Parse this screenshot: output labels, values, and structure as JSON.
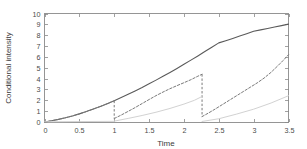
{
  "chart_data": {
    "type": "line",
    "title": "",
    "xlabel": "Time",
    "ylabel": "Conditional intensity",
    "xlim": [
      0,
      3.5
    ],
    "ylim": [
      0,
      10
    ],
    "grid": false,
    "legend": "none",
    "xticks": [
      "0",
      "0.5",
      "1",
      "1.5",
      "2",
      "2.5",
      "3",
      "3.5"
    ],
    "xtick_values": [
      0,
      0.5,
      1,
      1.5,
      2,
      2.5,
      3,
      3.5
    ],
    "yticks": [
      "0",
      "1",
      "2",
      "3",
      "4",
      "5",
      "6",
      "7",
      "8",
      "9",
      "10"
    ],
    "ytick_values": [
      0,
      1,
      2,
      3,
      4,
      5,
      6,
      7,
      8,
      9,
      10
    ],
    "event_times": [
      1.0,
      2.26
    ],
    "series": [
      {
        "name": "solid-upper-curve",
        "style": "solid",
        "color": "#5a5a5a",
        "width": 1.1,
        "points": [
          [
            0.0,
            0.0
          ],
          [
            0.1,
            0.11
          ],
          [
            0.2,
            0.24
          ],
          [
            0.3,
            0.39
          ],
          [
            0.4,
            0.56
          ],
          [
            0.5,
            0.75
          ],
          [
            0.6,
            0.96
          ],
          [
            0.7,
            1.19
          ],
          [
            0.8,
            1.43
          ],
          [
            0.9,
            1.69
          ],
          [
            1.0,
            1.96
          ],
          [
            1.1,
            2.25
          ],
          [
            1.2,
            2.55
          ],
          [
            1.3,
            2.86
          ],
          [
            1.4,
            3.18
          ],
          [
            1.5,
            3.52
          ],
          [
            1.6,
            3.86
          ],
          [
            1.7,
            4.21
          ],
          [
            1.8,
            4.57
          ],
          [
            1.9,
            4.94
          ],
          [
            2.0,
            5.32
          ],
          [
            2.1,
            5.7
          ],
          [
            2.2,
            6.09
          ],
          [
            2.3,
            6.49
          ],
          [
            2.4,
            6.89
          ],
          [
            2.5,
            7.29
          ],
          [
            2.6,
            7.49
          ],
          [
            2.7,
            7.7
          ],
          [
            2.8,
            7.92
          ],
          [
            2.9,
            8.14
          ],
          [
            3.0,
            8.36
          ],
          [
            3.1,
            8.49
          ],
          [
            3.2,
            8.62
          ],
          [
            3.3,
            8.75
          ],
          [
            3.4,
            8.88
          ],
          [
            3.5,
            9.02
          ]
        ]
      },
      {
        "name": "dashed-resetting-curve",
        "style": "dashed",
        "color": "#7a7a7a",
        "width": 1.0,
        "segments": [
          {
            "points": [
              [
                0.0,
                0.0
              ],
              [
                0.1,
                0.11
              ],
              [
                0.2,
                0.24
              ],
              [
                0.3,
                0.39
              ],
              [
                0.4,
                0.56
              ],
              [
                0.5,
                0.75
              ],
              [
                0.6,
                0.96
              ],
              [
                0.7,
                1.19
              ],
              [
                0.8,
                1.43
              ],
              [
                0.9,
                1.69
              ],
              [
                1.0,
                1.96
              ]
            ]
          },
          {
            "points": [
              [
                1.0,
                0.32
              ],
              [
                1.1,
                0.64
              ],
              [
                1.2,
                0.98
              ],
              [
                1.3,
                1.33
              ],
              [
                1.4,
                1.7
              ],
              [
                1.5,
                2.07
              ],
              [
                1.6,
                2.43
              ],
              [
                1.7,
                2.76
              ],
              [
                1.8,
                3.07
              ],
              [
                1.9,
                3.35
              ],
              [
                2.0,
                3.62
              ],
              [
                2.1,
                3.9
              ],
              [
                2.2,
                4.22
              ],
              [
                2.26,
                4.4
              ]
            ]
          },
          {
            "points": [
              [
                2.26,
                0.5
              ],
              [
                2.35,
                0.82
              ],
              [
                2.45,
                1.2
              ],
              [
                2.55,
                1.6
              ],
              [
                2.65,
                2.0
              ],
              [
                2.75,
                2.4
              ],
              [
                2.85,
                2.8
              ],
              [
                2.95,
                3.2
              ],
              [
                3.05,
                3.6
              ],
              [
                3.15,
                4.05
              ],
              [
                3.25,
                4.58
              ],
              [
                3.35,
                5.2
              ],
              [
                3.42,
                5.65
              ],
              [
                3.5,
                6.2
              ]
            ]
          }
        ],
        "drops": [
          {
            "x": 1.0,
            "from": 1.96,
            "to": 0.32
          },
          {
            "x": 2.26,
            "from": 4.4,
            "to": 0.5
          }
        ]
      },
      {
        "name": "light-gray-baseline-curve",
        "style": "solid",
        "color": "#d2d2d2",
        "width": 1.0,
        "segments": [
          {
            "points": [
              [
                0.0,
                0.02
              ],
              [
                0.5,
                0.04
              ],
              [
                1.0,
                0.06
              ]
            ]
          },
          {
            "points": [
              [
                1.0,
                0.08
              ],
              [
                1.2,
                0.33
              ],
              [
                1.4,
                0.6
              ],
              [
                1.6,
                0.9
              ],
              [
                1.8,
                1.25
              ],
              [
                2.0,
                1.65
              ],
              [
                2.15,
                2.0
              ],
              [
                2.26,
                2.35
              ]
            ]
          },
          {
            "points": [
              [
                2.26,
                0.05
              ],
              [
                2.5,
                0.3
              ],
              [
                2.75,
                0.72
              ],
              [
                3.0,
                1.18
              ],
              [
                3.25,
                1.75
              ],
              [
                3.5,
                2.42
              ]
            ]
          }
        ]
      }
    ]
  },
  "axes": {
    "x_axis_title": "Time",
    "y_axis_title": "Conditional intensity"
  }
}
